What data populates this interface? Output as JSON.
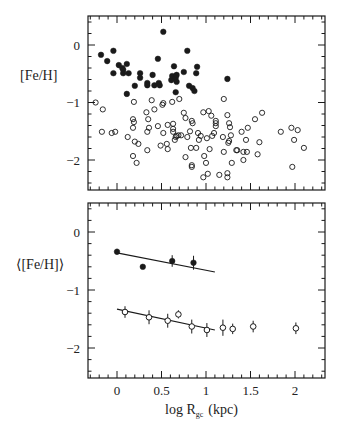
{
  "chart_data": [
    {
      "type": "scatter",
      "panel": "top",
      "title": "",
      "xlabel": "",
      "ylabel": "[Fe/H]",
      "xlim": [
        -0.33,
        2.33
      ],
      "ylim": [
        -2.5,
        0.5
      ],
      "yticks": [
        0,
        -1,
        -2
      ],
      "ytick_labels": [
        "0",
        "−1",
        "−2"
      ],
      "grid": false,
      "series": [
        {
          "name": "metal-rich (filled)",
          "marker": "filled-circle",
          "color": "#000000",
          "points": [
            [
              -0.18,
              -0.17
            ],
            [
              -0.11,
              -0.28
            ],
            [
              -0.04,
              -0.1
            ],
            [
              -0.04,
              -0.49
            ],
            [
              0.02,
              -0.35
            ],
            [
              0.06,
              -0.4
            ],
            [
              0.07,
              -0.43
            ],
            [
              0.07,
              -0.49
            ],
            [
              0.11,
              -0.33
            ],
            [
              0.11,
              -0.85
            ],
            [
              0.13,
              -0.49
            ],
            [
              0.2,
              -0.71
            ],
            [
              0.26,
              -0.49
            ],
            [
              0.26,
              -0.57
            ],
            [
              0.34,
              -0.66
            ],
            [
              0.34,
              -0.7
            ],
            [
              0.4,
              -0.52
            ],
            [
              0.42,
              -0.7
            ],
            [
              0.46,
              -0.24
            ],
            [
              0.47,
              -0.66
            ],
            [
              0.48,
              -0.7
            ],
            [
              0.52,
              0.23
            ],
            [
              0.61,
              -0.61
            ],
            [
              0.62,
              -0.54
            ],
            [
              0.64,
              -0.37
            ],
            [
              0.66,
              -0.57
            ],
            [
              0.67,
              -0.52
            ],
            [
              0.67,
              -0.64
            ],
            [
              0.66,
              -0.82
            ],
            [
              0.75,
              -0.47
            ],
            [
              0.79,
              -0.1
            ],
            [
              0.81,
              -0.71
            ],
            [
              0.85,
              -0.75
            ],
            [
              0.87,
              -0.8
            ],
            [
              0.89,
              -0.49
            ],
            [
              0.9,
              -0.38
            ],
            [
              1.24,
              -0.59
            ]
          ]
        },
        {
          "name": "metal-poor (open)",
          "marker": "open-circle",
          "color": "#000000",
          "points": [
            [
              -0.24,
              -1.0
            ],
            [
              -0.16,
              -1.12
            ],
            [
              -0.17,
              -1.51
            ],
            [
              -0.06,
              -1.53
            ],
            [
              -0.02,
              -1.51
            ],
            [
              0.12,
              -1.6
            ],
            [
              0.18,
              -1.44
            ],
            [
              0.18,
              -1.29
            ],
            [
              0.19,
              -1.34
            ],
            [
              0.19,
              -0.99
            ],
            [
              0.18,
              -1.93
            ],
            [
              0.2,
              -1.68
            ],
            [
              0.22,
              -2.05
            ],
            [
              0.24,
              -1.72
            ],
            [
              0.33,
              -1.17
            ],
            [
              0.34,
              -1.51
            ],
            [
              0.34,
              -1.83
            ],
            [
              0.35,
              -1.29
            ],
            [
              0.36,
              -1.44
            ],
            [
              0.39,
              -0.96
            ],
            [
              0.42,
              -1.12
            ],
            [
              0.46,
              -1.41
            ],
            [
              0.49,
              -1.75
            ],
            [
              0.51,
              -1.04
            ],
            [
              0.52,
              -1.53
            ],
            [
              0.52,
              -1.01
            ],
            [
              0.56,
              -1.72
            ],
            [
              0.57,
              -1.81
            ],
            [
              0.57,
              -1.39
            ],
            [
              0.62,
              -0.99
            ],
            [
              0.63,
              -1.37
            ],
            [
              0.63,
              -1.46
            ],
            [
              0.63,
              -1.51
            ],
            [
              0.65,
              -1.65
            ],
            [
              0.66,
              -1.6
            ],
            [
              0.67,
              -1.58
            ],
            [
              0.69,
              -1.57
            ],
            [
              0.7,
              -0.94
            ],
            [
              0.72,
              -1.57
            ],
            [
              0.75,
              -1.18
            ],
            [
              0.77,
              -1.27
            ],
            [
              0.77,
              -1.95
            ],
            [
              0.79,
              -1.6
            ],
            [
              0.82,
              -1.5
            ],
            [
              0.83,
              -1.79
            ],
            [
              0.84,
              -2.09
            ],
            [
              0.84,
              -1.32
            ],
            [
              0.84,
              -2.12
            ],
            [
              0.85,
              -1.36
            ],
            [
              0.89,
              -1.79
            ],
            [
              0.91,
              -1.53
            ],
            [
              0.92,
              -1.65
            ],
            [
              0.94,
              -1.58
            ],
            [
              0.97,
              -1.17
            ],
            [
              0.98,
              -1.93
            ],
            [
              0.97,
              -2.3
            ],
            [
              1.0,
              -2.05
            ],
            [
              1.01,
              -1.62
            ],
            [
              1.02,
              -2.24
            ],
            [
              1.03,
              -1.15
            ],
            [
              1.04,
              -1.81
            ],
            [
              1.06,
              -1.23
            ],
            [
              1.07,
              -1.58
            ],
            [
              1.09,
              -1.53
            ],
            [
              1.11,
              -1.41
            ],
            [
              1.11,
              -1.32
            ],
            [
              1.11,
              -1.36
            ],
            [
              1.15,
              -2.26
            ],
            [
              1.19,
              -1.6
            ],
            [
              1.2,
              -0.94
            ],
            [
              1.2,
              -1.86
            ],
            [
              1.24,
              -1.22
            ],
            [
              1.24,
              -2.23
            ],
            [
              1.24,
              -2.3
            ],
            [
              1.25,
              -1.7
            ],
            [
              1.26,
              -1.67
            ],
            [
              1.26,
              -1.36
            ],
            [
              1.27,
              -1.43
            ],
            [
              1.28,
              -1.57
            ],
            [
              1.29,
              -2.05
            ],
            [
              1.34,
              -1.83
            ],
            [
              1.35,
              -1.83
            ],
            [
              1.4,
              -1.51
            ],
            [
              1.42,
              -2.0
            ],
            [
              1.42,
              -1.86
            ],
            [
              1.45,
              -1.65
            ],
            [
              1.46,
              -1.86
            ],
            [
              1.47,
              -1.44
            ],
            [
              1.55,
              -1.29
            ],
            [
              1.58,
              -1.9
            ],
            [
              1.6,
              -1.69
            ],
            [
              1.63,
              -1.18
            ],
            [
              1.84,
              -1.51
            ],
            [
              1.96,
              -1.44
            ],
            [
              1.97,
              -2.12
            ],
            [
              1.99,
              -1.65
            ],
            [
              2.03,
              -1.48
            ],
            [
              2.1,
              -1.79
            ]
          ]
        }
      ]
    },
    {
      "type": "scatter",
      "panel": "bottom",
      "title": "",
      "xlabel": "log R_gc (kpc)",
      "ylabel": "⟨[Fe/H]⟩",
      "xlim": [
        -0.33,
        2.33
      ],
      "ylim": [
        -2.5,
        0.5
      ],
      "xticks": [
        0,
        0.5,
        1,
        1.5,
        2
      ],
      "xtick_labels": [
        "0",
        "0.5",
        "1",
        "1.5",
        "2"
      ],
      "yticks": [
        0,
        -1,
        -2
      ],
      "ytick_labels": [
        "0",
        "−1",
        "−2"
      ],
      "grid": false,
      "series": [
        {
          "name": "metal-rich mean (filled)",
          "marker": "filled-circle",
          "color": "#000000",
          "points": [
            {
              "x": 0.0,
              "y": -0.34,
              "err": 0.05
            },
            {
              "x": 0.29,
              "y": -0.6,
              "err": 0.03
            },
            {
              "x": 0.62,
              "y": -0.5,
              "err": 0.1
            },
            {
              "x": 0.86,
              "y": -0.53,
              "err": 0.12
            }
          ],
          "fit_line": {
            "x": [
              0.0,
              1.1
            ],
            "y": [
              -0.36,
              -0.69
            ]
          }
        },
        {
          "name": "metal-poor mean (open)",
          "marker": "open-circle",
          "color": "#000000",
          "points": [
            {
              "x": 0.09,
              "y": -1.38,
              "err": 0.1
            },
            {
              "x": 0.36,
              "y": -1.47,
              "err": 0.12
            },
            {
              "x": 0.57,
              "y": -1.53,
              "err": 0.12
            },
            {
              "x": 0.69,
              "y": -1.42,
              "err": 0.07
            },
            {
              "x": 0.84,
              "y": -1.63,
              "err": 0.12
            },
            {
              "x": 1.01,
              "y": -1.69,
              "err": 0.12
            },
            {
              "x": 1.19,
              "y": -1.65,
              "err": 0.14
            },
            {
              "x": 1.3,
              "y": -1.67,
              "err": 0.09
            },
            {
              "x": 1.53,
              "y": -1.63,
              "err": 0.1
            },
            {
              "x": 2.01,
              "y": -1.66,
              "err": 0.1
            }
          ],
          "fit_line": {
            "x": [
              0.0,
              1.1
            ],
            "y": [
              -1.33,
              -1.69
            ]
          }
        }
      ]
    }
  ],
  "labels": {
    "top_ylabel": "[Fe/H]",
    "bottom_ylabel": "⟨[Fe/H]⟩",
    "xlabel_main": "log R",
    "xlabel_sub": "gc",
    "xlabel_unit": "(kpc)"
  },
  "style": {
    "ink_color": "#1a1a1a",
    "background": "#ffffff"
  }
}
